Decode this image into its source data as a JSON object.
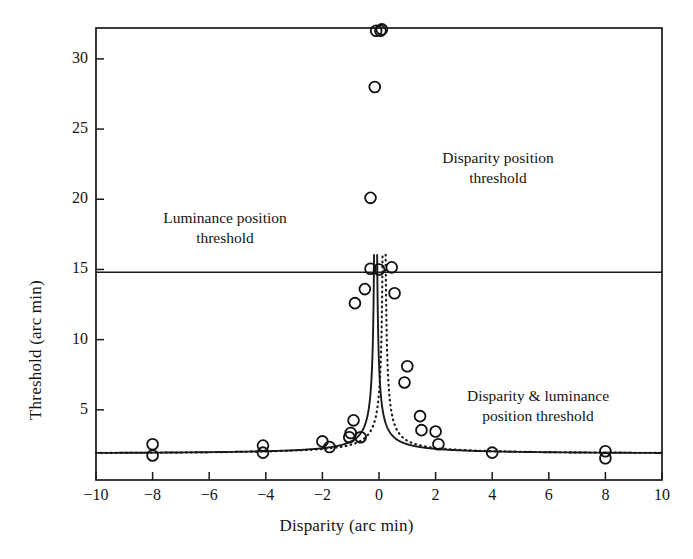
{
  "chart_data": {
    "type": "scatter",
    "title": "",
    "xlabel": "Disparity (arc min)",
    "ylabel": "Threshold (arc min)",
    "xlim": [
      -10,
      10
    ],
    "ylim": [
      0,
      32.2
    ],
    "xticks": [
      -10,
      -8,
      -6,
      -4,
      -2,
      0,
      2,
      4,
      6,
      8,
      10
    ],
    "xtick_labels": [
      "-10",
      "-8",
      "-6",
      "-4",
      "-2",
      "0",
      "2",
      "4",
      "6",
      "8",
      "10"
    ],
    "yticks": [
      5,
      10,
      15,
      20,
      25,
      30
    ],
    "ytick_labels": [
      "5",
      "10",
      "15",
      "20",
      "25",
      "30"
    ],
    "grid": false,
    "legend": "none",
    "annotations": [
      {
        "name": "luminance-position-threshold",
        "line1": "Luminance position",
        "line2": "threshold"
      },
      {
        "name": "disparity-position-threshold",
        "line1": "Disparity position",
        "line2": "threshold"
      },
      {
        "name": "disparity-and-luminance-position-threshold",
        "line1": "Disparity & luminance",
        "line2": "position threshold"
      }
    ],
    "reference_lines": [
      {
        "name": "luminance-ceiling",
        "orientation": "horizontal",
        "y": 14.8,
        "style": "solid"
      }
    ],
    "series": [
      {
        "name": "Luminance position threshold (solid fit)",
        "style": "solid",
        "marker": "open-circle",
        "points": [
          {
            "x": -8.0,
            "y": 2.55
          },
          {
            "x": -8.0,
            "y": 1.75
          },
          {
            "x": -4.1,
            "y": 2.45
          },
          {
            "x": -4.1,
            "y": 1.95
          },
          {
            "x": -2.0,
            "y": 2.75
          },
          {
            "x": -1.75,
            "y": 2.35
          },
          {
            "x": -1.0,
            "y": 3.35
          },
          {
            "x": -0.9,
            "y": 4.25
          },
          {
            "x": -0.85,
            "y": 12.6
          },
          {
            "x": -0.5,
            "y": 13.6
          },
          {
            "x": -0.3,
            "y": 15.05
          },
          {
            "x": -0.3,
            "y": 20.1
          },
          {
            "x": -0.15,
            "y": 28.0
          },
          {
            "x": -0.1,
            "y": 32.0
          },
          {
            "x": 0.1,
            "y": 32.1
          },
          {
            "x": 0.45,
            "y": 15.15
          },
          {
            "x": 0.55,
            "y": 13.3
          },
          {
            "x": 0.9,
            "y": 6.95
          },
          {
            "x": 1.0,
            "y": 8.1
          },
          {
            "x": 1.45,
            "y": 4.55
          },
          {
            "x": 1.5,
            "y": 3.55
          },
          {
            "x": 2.0,
            "y": 3.45
          },
          {
            "x": 2.1,
            "y": 2.55
          },
          {
            "x": 4.0,
            "y": 1.95
          },
          {
            "x": 8.0,
            "y": 2.05
          },
          {
            "x": 8.0,
            "y": 1.55
          }
        ]
      },
      {
        "name": "Disparity position threshold (dotted fit)",
        "style": "dotted",
        "marker": "open-circle",
        "points": [
          {
            "x": -1.05,
            "y": 3.05
          },
          {
            "x": -0.65,
            "y": 3.05
          },
          {
            "x": 0.0,
            "y": 15.0
          },
          {
            "x": 0.05,
            "y": 32.0
          }
        ]
      }
    ],
    "fit_curves": [
      {
        "name": "luminance-fit",
        "style": "solid",
        "asymptote_x": -0.12,
        "baseline_y": 1.85
      },
      {
        "name": "disparity-fit",
        "style": "dotted",
        "asymptote_x": 0.18,
        "baseline_y": 1.85
      }
    ]
  }
}
